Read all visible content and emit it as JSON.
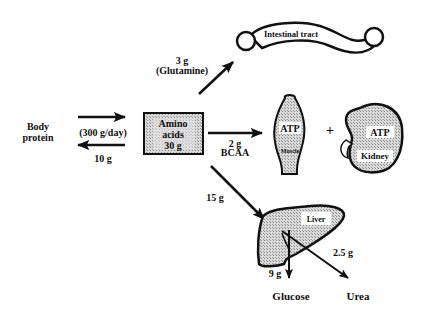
{
  "diagram": {
    "nodes": {
      "body_protein": {
        "line1": "Body",
        "line2": "protein"
      },
      "amino_acids": {
        "line1": "Amino",
        "line2": "acids",
        "line3": "30 g"
      },
      "intestinal_tract": {
        "label": "Intestinal tract"
      },
      "muscle": {
        "atp": "ATP",
        "label": "Muscle"
      },
      "plus": "+",
      "kidney": {
        "atp": "ATP",
        "label": "Kidney"
      },
      "liver": {
        "label": "Liver"
      },
      "glucose": {
        "label": "Glucose"
      },
      "urea": {
        "label": "Urea"
      }
    },
    "flows": {
      "to_amino": {
        "label": "(300 g/day)"
      },
      "to_body": {
        "label": "10 g"
      },
      "glutamine": {
        "amount": "3 g",
        "label": "(Glutamine)"
      },
      "bcaa": {
        "amount": "2 g",
        "label": "BCAA"
      },
      "to_liver": {
        "label": "15 g"
      },
      "to_glucose": {
        "label": "9 g"
      },
      "to_urea": {
        "label": "2.5 g"
      }
    },
    "colors": {
      "ink": "#111111",
      "fill_stipple": "#c8c8c8",
      "background": "#ffffff"
    }
  }
}
